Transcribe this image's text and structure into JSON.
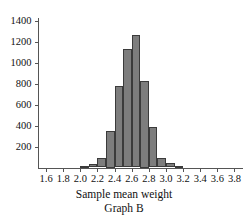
{
  "chart_data": {
    "type": "bar",
    "title": "",
    "subtitle": "",
    "xlabel": "Sample mean weight",
    "annotation": "Graph B",
    "bin_width": 0.1,
    "grid": false,
    "legend": null,
    "xlim": [
      1.5,
      3.9
    ],
    "ylim": [
      0,
      1400
    ],
    "xticks": [
      "1.6",
      "1.8",
      "2.0",
      "2.2",
      "2.4",
      "2.6",
      "2.8",
      "3.0",
      "3.2",
      "3.4",
      "3.6",
      "3.8"
    ],
    "xtick_values": [
      1.6,
      1.8,
      2.0,
      2.2,
      2.4,
      2.6,
      2.8,
      3.0,
      3.2,
      3.4,
      3.6,
      3.8
    ],
    "yticks": [
      "200",
      "400",
      "600",
      "800",
      "1000",
      "1200",
      "1400"
    ],
    "ytick_values": [
      200,
      400,
      600,
      800,
      1000,
      1200,
      1400
    ],
    "bins": [
      {
        "left": 2.0,
        "right": 2.1,
        "value": 10
      },
      {
        "left": 2.1,
        "right": 2.2,
        "value": 30
      },
      {
        "left": 2.2,
        "right": 2.3,
        "value": 95
      },
      {
        "left": 2.3,
        "right": 2.4,
        "value": 350
      },
      {
        "left": 2.4,
        "right": 2.5,
        "value": 780
      },
      {
        "left": 2.5,
        "right": 2.6,
        "value": 1130
      },
      {
        "left": 2.6,
        "right": 2.7,
        "value": 1260
      },
      {
        "left": 2.7,
        "right": 2.8,
        "value": 825
      },
      {
        "left": 2.8,
        "right": 2.9,
        "value": 390
      },
      {
        "left": 2.9,
        "right": 3.0,
        "value": 95
      },
      {
        "left": 3.0,
        "right": 3.1,
        "value": 40
      },
      {
        "left": 3.1,
        "right": 3.2,
        "value": 15
      }
    ],
    "bar_color": "#7d7d7d",
    "bar_edge_color": "#3b3b3b",
    "axis_color": "#555555"
  }
}
